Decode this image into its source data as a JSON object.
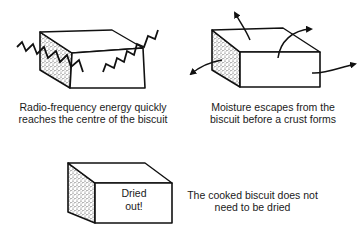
{
  "panels": [
    {
      "id": "rf-energy",
      "illustration": "biscuit-block-with-zigzag-energy-waves",
      "caption": "Radio-frequency energy quickly reaches the centre of the biscuit"
    },
    {
      "id": "moisture-escapes",
      "illustration": "biscuit-block-with-moisture-arrows",
      "caption": "Moisture escapes from the biscuit before a crust forms"
    },
    {
      "id": "no-drying",
      "illustration": "biscuit-block-labelled",
      "box_label_line1": "Dried",
      "box_label_line2": "out!",
      "caption": "The cooked biscuit does not need to be dried"
    }
  ],
  "colors": {
    "ink": "#111111",
    "background": "#ffffff",
    "stipple": "#555555"
  }
}
